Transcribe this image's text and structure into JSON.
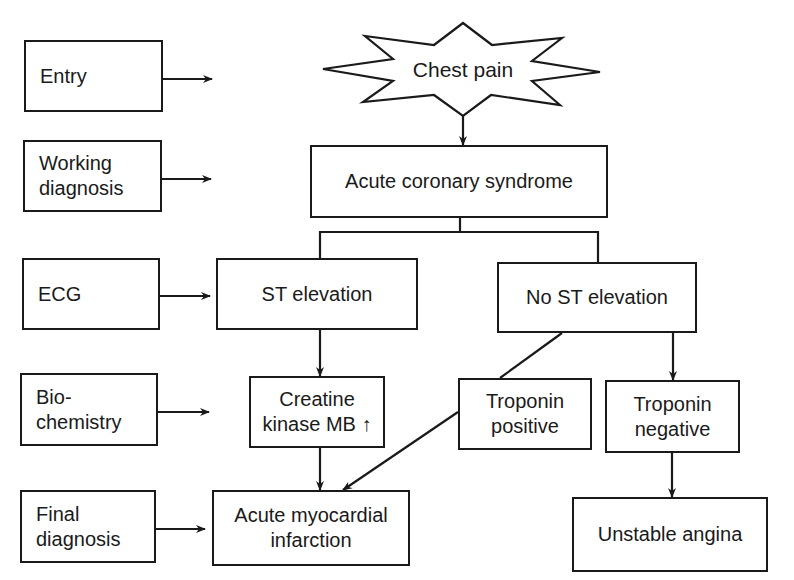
{
  "diagram": {
    "stages": [
      {
        "id": "entry",
        "label": "Entry"
      },
      {
        "id": "working",
        "label": "Working\ndiagnosis"
      },
      {
        "id": "ecg",
        "label": "ECG"
      },
      {
        "id": "biochem",
        "label": "Bio-\nchemistry"
      },
      {
        "id": "final",
        "label": "Final\ndiagnosis"
      }
    ],
    "nodes": {
      "chest_pain": "Chest pain",
      "acs": "Acute coronary syndrome",
      "st_elevation": "ST elevation",
      "no_st_elevation": "No ST elevation",
      "ck_mb": "Creatine\nkinase MB ↑",
      "troponin_positive": "Troponin\npositive",
      "troponin_negative": "Troponin\nnegative",
      "ami": "Acute myocardial\ninfarction",
      "unstable_angina": "Unstable angina"
    },
    "edges": [
      [
        "chest_pain",
        "acs"
      ],
      [
        "acs",
        "st_elevation"
      ],
      [
        "acs",
        "no_st_elevation"
      ],
      [
        "st_elevation",
        "ck_mb"
      ],
      [
        "no_st_elevation",
        "troponin_positive"
      ],
      [
        "no_st_elevation",
        "troponin_negative"
      ],
      [
        "ck_mb",
        "ami"
      ],
      [
        "troponin_positive",
        "ami"
      ],
      [
        "troponin_negative",
        "unstable_angina"
      ]
    ],
    "colors": {
      "stroke": "#1a1a1a",
      "background": "#ffffff"
    }
  }
}
